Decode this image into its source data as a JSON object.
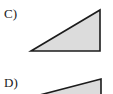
{
  "page": {
    "background_color": "#ffffff",
    "width": 113,
    "height": 94
  },
  "choices": [
    {
      "id": "c",
      "label": "C)",
      "shape_name": "right-triangle",
      "fill_color": "#dcdcdc",
      "stroke_color": "#1c1c1c",
      "orientation": "right angle at bottom-right, hypotenuse ascending to the right",
      "vertices": [
        [
          4,
          45
        ],
        [
          73,
          4
        ],
        [
          73,
          45
        ]
      ],
      "box_width": 78,
      "box_height": 50
    },
    {
      "id": "d",
      "label": "D)",
      "shape_name": "flattened-right-triangle",
      "fill_color": "#dcdcdc",
      "stroke_color": "#1c1c1c",
      "orientation": "very flat right triangle, hypotenuse ascending to the right, clipped by image bottom edge",
      "vertices": [
        [
          3,
          22
        ],
        [
          72,
          4
        ],
        [
          72,
          22
        ]
      ],
      "box_width": 77,
      "box_height": 28
    }
  ]
}
